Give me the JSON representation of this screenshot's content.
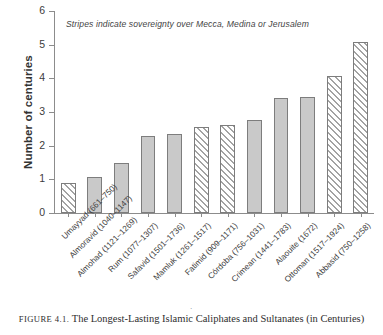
{
  "chart_data": {
    "type": "bar",
    "title": "",
    "xlabel": "",
    "ylabel": "Number of centuries",
    "ylim": [
      0,
      6
    ],
    "yticks": [
      0,
      1,
      2,
      3,
      4,
      5,
      6
    ],
    "grid": false,
    "legend": null,
    "annotation": "Stripes indicate sovereignty over Mecca, Medina or Jerusalem",
    "categories": [
      "Umayyad (661–750)",
      "Almoravid (1040–1147)",
      "Almohad (1121–1269)",
      "Rum (1077–1307)",
      "Safavid (1501–1736)",
      "Mamluk (1261–1517)",
      "Fatimid (909–1171)",
      "Córdoba (756–1031)",
      "Crimean (1441–1783)",
      "Alaouite (1672)",
      "Ottoman (1517–1924)",
      "Abbasid (750–1258)"
    ],
    "values": [
      0.89,
      1.07,
      1.48,
      2.3,
      2.35,
      2.56,
      2.62,
      2.75,
      3.42,
      3.44,
      4.07,
      5.08
    ],
    "bar_styles": [
      "hatched",
      "solid",
      "solid",
      "solid",
      "solid",
      "hatched",
      "hatched",
      "solid",
      "solid",
      "solid",
      "hatched",
      "hatched"
    ],
    "bar_fill_color": "#c9c9c9",
    "bar_edge_color": "#7d7d7d",
    "hatch_note": "Diagonal stripes mark caliphates/sultanates holding Mecca, Medina or Jerusalem"
  },
  "caption": {
    "figure_number": "FIGURE 4.1.",
    "text": "The Longest-Lasting Islamic Caliphates and Sultanates (in Centuries)"
  },
  "marks": {
    "page_tick": "·"
  }
}
